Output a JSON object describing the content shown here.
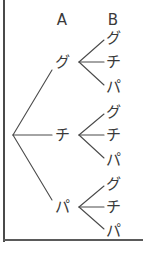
{
  "figure": {
    "type": "probability-tree-diagram",
    "background_color": "#ffffff",
    "ink_color": "#3a3a3a",
    "frame_color": "#4a4a4a",
    "width": 143,
    "height": 253
  },
  "columns": [
    {
      "id": "A",
      "label": "A",
      "x": 62,
      "y": 20
    },
    {
      "id": "B",
      "label": "B",
      "x": 113,
      "y": 20
    }
  ],
  "root": {
    "x": 13,
    "y": 135
  },
  "level1": [
    {
      "key": "a-gu",
      "label": "グ",
      "x": 62,
      "y": 62,
      "fan_x": 79,
      "fan_y": 62
    },
    {
      "key": "a-chi",
      "label": "チ",
      "x": 62,
      "y": 135,
      "fan_x": 79,
      "fan_y": 135
    },
    {
      "key": "a-pa",
      "label": "パ",
      "x": 62,
      "y": 207,
      "fan_x": 79,
      "fan_y": 207
    }
  ],
  "level2": [
    {
      "parent": "a-gu",
      "key": "a-gu-b-gu",
      "label": "グ",
      "x": 113,
      "y": 38
    },
    {
      "parent": "a-gu",
      "key": "a-gu-b-chi",
      "label": "チ",
      "x": 113,
      "y": 62
    },
    {
      "parent": "a-gu",
      "key": "a-gu-b-pa",
      "label": "パ",
      "x": 113,
      "y": 87
    },
    {
      "parent": "a-chi",
      "key": "a-chi-b-gu",
      "label": "グ",
      "x": 113,
      "y": 112
    },
    {
      "parent": "a-chi",
      "key": "a-chi-b-chi",
      "label": "チ",
      "x": 113,
      "y": 135
    },
    {
      "parent": "a-chi",
      "key": "a-chi-b-pa",
      "label": "パ",
      "x": 113,
      "y": 160
    },
    {
      "parent": "a-pa",
      "key": "a-pa-b-gu",
      "label": "グ",
      "x": 113,
      "y": 184
    },
    {
      "parent": "a-pa",
      "key": "a-pa-b-chi",
      "label": "チ",
      "x": 113,
      "y": 207
    },
    {
      "parent": "a-pa",
      "key": "a-pa-b-pa",
      "label": "パ",
      "x": 113,
      "y": 231
    }
  ],
  "edges": {
    "root_to_level1": [
      {
        "x1": 13,
        "y1": 135,
        "x2": 52,
        "y2": 70
      },
      {
        "x1": 13,
        "y1": 135,
        "x2": 52,
        "y2": 135
      },
      {
        "x1": 13,
        "y1": 135,
        "x2": 52,
        "y2": 200
      }
    ],
    "level1_to_level2": [
      {
        "x1": 79,
        "y1": 62,
        "x2": 104,
        "y2": 40
      },
      {
        "x1": 79,
        "y1": 62,
        "x2": 104,
        "y2": 62
      },
      {
        "x1": 79,
        "y1": 62,
        "x2": 104,
        "y2": 85
      },
      {
        "x1": 79,
        "y1": 135,
        "x2": 104,
        "y2": 114
      },
      {
        "x1": 79,
        "y1": 135,
        "x2": 104,
        "y2": 135
      },
      {
        "x1": 79,
        "y1": 135,
        "x2": 104,
        "y2": 158
      },
      {
        "x1": 79,
        "y1": 207,
        "x2": 104,
        "y2": 186
      },
      {
        "x1": 79,
        "y1": 207,
        "x2": 104,
        "y2": 207
      },
      {
        "x1": 79,
        "y1": 207,
        "x2": 104,
        "y2": 229
      }
    ]
  }
}
